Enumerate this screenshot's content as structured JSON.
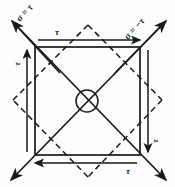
{
  "figure": {
    "line_color": "#1a1a1a",
    "background_color": "#fdfdfd"
  },
  "labels": {
    "shear_top": "τ",
    "shear_left": "τ",
    "shear_right": "τ",
    "shear_bottom": "τ",
    "principal_tension": "σ = τ",
    "principal_compression": "σ = −τ"
  },
  "geometry": {
    "square": {
      "left": 35,
      "top": 47,
      "right": 140,
      "bottom": 155
    },
    "diamond": {
      "top_x": 88,
      "top_y": 25,
      "right_x": 162,
      "right_y": 100,
      "bottom_x": 88,
      "bottom_y": 177,
      "left_x": 13,
      "left_y": 100
    },
    "center": {
      "x": 87,
      "y": 101,
      "radius": 11
    },
    "diagonal_nw_end": {
      "x": 12,
      "y": 21
    },
    "diagonal_se_end": {
      "x": 166,
      "y": 180
    },
    "diagonal_ne_end": {
      "x": 166,
      "y": 21
    },
    "diagonal_sw_end": {
      "x": 11,
      "y": 180
    }
  },
  "arrows": {
    "top": {
      "direction": "right",
      "x1": 38,
      "x2": 142,
      "y": 40
    },
    "bottom": {
      "direction": "left",
      "x1": 137,
      "x2": 33,
      "y": 163
    },
    "left": {
      "direction": "up",
      "y1": 152,
      "y2": 48,
      "x": 27
    },
    "right": {
      "direction": "down",
      "y1": 50,
      "y2": 154,
      "x": 148
    }
  }
}
